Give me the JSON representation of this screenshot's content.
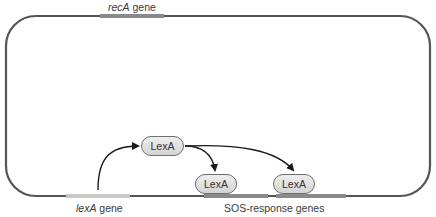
{
  "diagram": {
    "colors": {
      "chromosome": "#555555",
      "recA_gene": "#8a8a8a",
      "lexA_gene": "#c8c8c8",
      "sos_gene": "#8a8a8a",
      "pill_border": "#6e6e6e",
      "arrow": "#1a1a1a"
    },
    "genes": {
      "recA": {
        "name": "recA",
        "suffix": " gene"
      },
      "lexA": {
        "name": "lexA",
        "suffix": " gene"
      },
      "sos": {
        "label": "SOS-response genes"
      }
    },
    "proteins": [
      {
        "label": "LexA",
        "role": "free"
      },
      {
        "label": "LexA",
        "role": "bound-sos-gene-1"
      },
      {
        "label": "LexA",
        "role": "bound-sos-gene-2"
      }
    ]
  }
}
